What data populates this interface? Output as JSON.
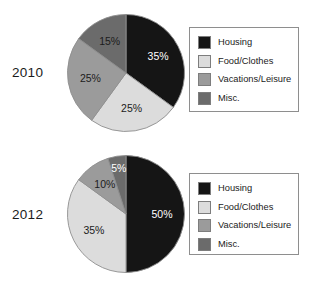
{
  "figure": {
    "background": "#ffffff",
    "categories": [
      "Housing",
      "Food/Clothes",
      "Vacations/Leisure",
      "Misc."
    ],
    "colors": {
      "housing": "#151515",
      "food_clothes": "#dcdcdc",
      "vacations_leisure": "#9b9b9b",
      "misc": "#6b6b6b",
      "outline": "#8e8e8e",
      "label_dark": "#1b1b1b",
      "label_light": "#ffffff"
    }
  },
  "charts": [
    {
      "id": "chart-2010",
      "year_label": "2010",
      "legend": [
        {
          "label": "Housing",
          "color": "#151515"
        },
        {
          "label": "Food/Clothes",
          "color": "#dcdcdc"
        },
        {
          "label": "Vacations/Leisure",
          "color": "#9b9b9b"
        },
        {
          "label": "Misc.",
          "color": "#6b6b6b"
        }
      ]
    },
    {
      "id": "chart-2012",
      "year_label": "2012",
      "legend": [
        {
          "label": "Housing",
          "color": "#151515"
        },
        {
          "label": "Food/Clothes",
          "color": "#dcdcdc"
        },
        {
          "label": "Vacations/Leisure",
          "color": "#9b9b9b"
        },
        {
          "label": "Misc.",
          "color": "#6b6b6b"
        }
      ]
    }
  ],
  "chart_data": [
    {
      "type": "pie",
      "title": "2010",
      "categories": [
        "Housing",
        "Food/Clothes",
        "Vacations/Leisure",
        "Misc."
      ],
      "values": [
        35,
        25,
        25,
        15
      ],
      "labels": [
        "35%",
        "25%",
        "25%",
        "15%"
      ],
      "colors": [
        "#151515",
        "#dcdcdc",
        "#9b9b9b",
        "#6b6b6b"
      ],
      "label_colors": [
        "#ffffff",
        "#1b1b1b",
        "#1b1b1b",
        "#1b1b1b"
      ],
      "start_angle_deg": 0,
      "direction": "clockwise",
      "legend_position": "right",
      "units": "percent"
    },
    {
      "type": "pie",
      "title": "2012",
      "categories": [
        "Housing",
        "Food/Clothes",
        "Vacations/Leisure",
        "Misc."
      ],
      "values": [
        50,
        35,
        10,
        5
      ],
      "labels": [
        "50%",
        "35%",
        "10%",
        "5%"
      ],
      "colors": [
        "#151515",
        "#dcdcdc",
        "#9b9b9b",
        "#6b6b6b"
      ],
      "label_colors": [
        "#ffffff",
        "#1b1b1b",
        "#1b1b1b",
        "#ffffff"
      ],
      "start_angle_deg": 0,
      "direction": "clockwise",
      "legend_position": "right",
      "units": "percent"
    }
  ]
}
